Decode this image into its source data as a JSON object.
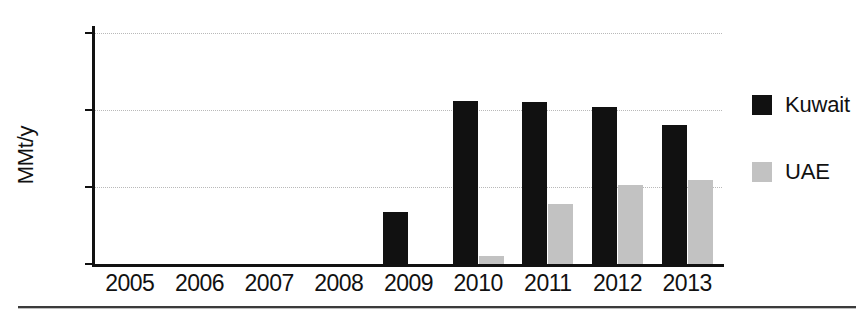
{
  "chart_data": {
    "type": "bar",
    "title": "",
    "subtitle": "",
    "xlabel": "",
    "ylabel": "MMt/y",
    "categories": [
      "2005",
      "2006",
      "2007",
      "2008",
      "2009",
      "2010",
      "2011",
      "2012",
      "2013"
    ],
    "series": [
      {
        "name": "Kuwait",
        "color": "#111111",
        "values": [
          0,
          0,
          0,
          0,
          0.68,
          2.12,
          2.1,
          2.04,
          1.8
        ]
      },
      {
        "name": "UAE",
        "color": "#c2c2c2",
        "values": [
          0,
          0,
          0,
          0,
          0,
          0.11,
          0.78,
          1.02,
          1.09
        ]
      }
    ],
    "ylim": [
      0,
      3
    ],
    "yticks": [
      0,
      1,
      2,
      3
    ],
    "ytick_labels": [
      "0",
      "1",
      "2",
      "3"
    ],
    "grid": true,
    "grid_style": "dotted",
    "grid_color": "#b9b9b9",
    "legend_position": "right",
    "axis_color": "#111111",
    "background": "#ffffff"
  },
  "legend": {
    "entries": [
      {
        "label": "Kuwait",
        "color": "#111111"
      },
      {
        "label": "UAE",
        "color": "#c2c2c2"
      }
    ]
  }
}
